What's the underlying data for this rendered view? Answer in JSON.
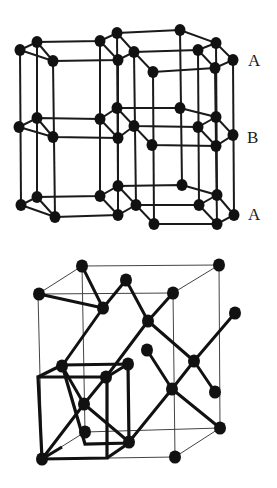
{
  "hcp": {
    "title": "Hexagonal close-packed structure",
    "layer_labels": [
      {
        "text": "A",
        "x": 248,
        "y": 52
      },
      {
        "text": "B",
        "x": 247,
        "y": 129
      },
      {
        "text": "A",
        "x": 248,
        "y": 206
      }
    ],
    "atoms": [
      [
        20,
        50
      ],
      [
        37,
        42
      ],
      [
        53,
        61
      ],
      [
        100,
        41
      ],
      [
        117,
        33
      ],
      [
        118,
        60
      ],
      [
        134,
        52
      ],
      [
        153,
        72
      ],
      [
        180,
        30
      ],
      [
        198,
        50
      ],
      [
        216,
        43
      ],
      [
        215,
        68
      ],
      [
        233,
        60
      ],
      [
        19,
        127
      ],
      [
        37,
        118
      ],
      [
        53,
        137
      ],
      [
        100,
        119
      ],
      [
        117,
        108
      ],
      [
        118,
        138
      ],
      [
        134,
        126
      ],
      [
        152,
        145
      ],
      [
        180,
        108
      ],
      [
        198,
        127
      ],
      [
        216,
        117
      ],
      [
        216,
        146
      ],
      [
        233,
        135
      ],
      [
        21,
        205
      ],
      [
        37,
        197
      ],
      [
        55,
        217
      ],
      [
        100,
        196
      ],
      [
        118,
        186
      ],
      [
        118,
        215
      ],
      [
        136,
        205
      ],
      [
        154,
        224
      ],
      [
        182,
        185
      ],
      [
        199,
        205
      ],
      [
        217,
        195
      ],
      [
        217,
        224
      ],
      [
        234,
        215
      ]
    ]
  },
  "diamond": {
    "title": "Diamond cubic structure",
    "cube": {
      "front": [
        [
          38,
          294
        ],
        [
          173,
          293
        ],
        [
          175,
          457
        ],
        [
          42,
          459
        ]
      ],
      "back": [
        [
          82,
          266
        ],
        [
          219,
          265
        ],
        [
          220,
          428
        ],
        [
          85,
          432
        ]
      ]
    },
    "small_cube": {
      "front": [
        [
          38,
          377
        ],
        [
          107,
          377
        ],
        [
          107,
          458
        ],
        [
          42,
          459
        ]
      ],
      "back": [
        [
          62,
          365
        ],
        [
          128,
          364
        ],
        [
          129,
          443
        ],
        [
          85,
          432
        ]
      ]
    },
    "atoms": [
      [
        82,
        266
      ],
      [
        219,
        265
      ],
      [
        39,
        294
      ],
      [
        126,
        280
      ],
      [
        173,
        293
      ],
      [
        103,
        308
      ],
      [
        148,
        321
      ],
      [
        235,
        313
      ],
      [
        147,
        350
      ],
      [
        194,
        361
      ],
      [
        62,
        366
      ],
      [
        128,
        364
      ],
      [
        106,
        377
      ],
      [
        172,
        389
      ],
      [
        215,
        392
      ],
      [
        84,
        404
      ],
      [
        85,
        432
      ],
      [
        220,
        428
      ],
      [
        129,
        442
      ],
      [
        42,
        459
      ],
      [
        175,
        457
      ]
    ],
    "bonds": [
      [
        [
          82,
          266
        ],
        [
          103,
          308
        ]
      ],
      [
        [
          126,
          280
        ],
        [
          103,
          308
        ]
      ],
      [
        [
          103,
          308
        ],
        [
          39,
          294
        ]
      ],
      [
        [
          103,
          308
        ],
        [
          62,
          366
        ]
      ],
      [
        [
          126,
          280
        ],
        [
          148,
          321
        ]
      ],
      [
        [
          173,
          293
        ],
        [
          148,
          321
        ]
      ],
      [
        [
          148,
          321
        ],
        [
          106,
          377
        ]
      ],
      [
        [
          148,
          321
        ],
        [
          194,
          361
        ]
      ],
      [
        [
          235,
          313
        ],
        [
          194,
          361
        ]
      ],
      [
        [
          194,
          361
        ],
        [
          215,
          392
        ]
      ],
      [
        [
          194,
          361
        ],
        [
          172,
          389
        ]
      ],
      [
        [
          147,
          350
        ],
        [
          172,
          389
        ]
      ],
      [
        [
          172,
          389
        ],
        [
          220,
          428
        ]
      ],
      [
        [
          172,
          389
        ],
        [
          129,
          442
        ]
      ],
      [
        [
          84,
          404
        ],
        [
          62,
          366
        ]
      ],
      [
        [
          84,
          404
        ],
        [
          106,
          377
        ]
      ],
      [
        [
          84,
          404
        ],
        [
          42,
          459
        ]
      ],
      [
        [
          84,
          404
        ],
        [
          129,
          442
        ]
      ]
    ]
  },
  "colors": {
    "atom": "#111111",
    "line": "#1a1a1a",
    "thin": "#555555"
  }
}
